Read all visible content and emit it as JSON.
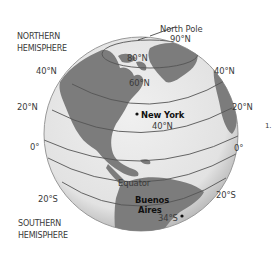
{
  "diagram": {
    "hemispheres": {
      "north": [
        "NORTHERN",
        "HEMISPHERE"
      ],
      "south": [
        "SOUTHERN",
        "HEMISPHERE"
      ]
    },
    "pole": {
      "label": "North Pole",
      "lat": "90°N"
    },
    "latitudes_left": [
      "40°N",
      "20°N",
      "0°",
      "20°S"
    ],
    "latitudes_right": [
      "40°N",
      "20°N",
      "0°",
      "20°S"
    ],
    "inner_latitudes": [
      "80°N",
      "60°N"
    ],
    "equator_label": "Equator",
    "cities": [
      {
        "name": "New York",
        "lat": "40°N"
      },
      {
        "name_line1": "Buenos",
        "name_line2": "Aires",
        "lat": "34°S"
      }
    ],
    "side_mark": "1.",
    "colors": {
      "ocean": "#e6e6e6",
      "land": "#7a7a7a",
      "outline": "#8a8a8a",
      "lines": "#555555"
    }
  }
}
